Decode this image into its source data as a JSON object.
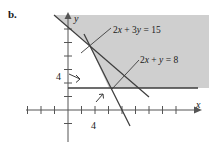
{
  "figure": {
    "part_label": "b.",
    "background_color": "#ffffff",
    "shade_color": "#cfcfcf",
    "line_color": "#3d3d3d",
    "axis_color": "#555555"
  },
  "axes": {
    "x_name": "x",
    "y_name": "y",
    "x_tick_label": "4",
    "y_tick_label": "4",
    "x_axis_y_px": 110,
    "y_axis_x_px": 68,
    "tick_spacing_px": 13.5,
    "x_ticks_left": 3,
    "x_ticks_right": 9,
    "y_ticks_up": 7,
    "y_ticks_down": 2
  },
  "labels": {
    "line1": "2x + 3y = 15",
    "line2": "2x + y = 8"
  },
  "chart_data": {
    "type": "line",
    "title": "",
    "xlabel": "x",
    "ylabel": "y",
    "grid": false,
    "legend": "none",
    "xlim": [
      -3,
      9
    ],
    "ylim": [
      -2,
      7
    ],
    "xticks": [
      -3,
      -2,
      -1,
      0,
      1,
      2,
      3,
      4,
      5,
      6,
      7,
      8,
      9
    ],
    "yticks": [
      -2,
      -1,
      0,
      1,
      2,
      3,
      4,
      5,
      6,
      7
    ],
    "xticklabels": [
      "4"
    ],
    "yticklabels": [
      "4"
    ],
    "series": [
      {
        "name": "2x + 3y = 15",
        "equation": "2x + 3y = 15",
        "slope": -0.6667,
        "intercept": 5,
        "points": [
          [
            -1.5,
            6
          ],
          [
            6,
            1
          ]
        ],
        "style": "solid"
      },
      {
        "name": "2x + y = 8",
        "equation": "2x + y = 8",
        "slope": -2,
        "intercept": 8,
        "points": [
          [
            1.2,
            5.6
          ],
          [
            4.6,
            -1.2
          ]
        ],
        "style": "solid"
      },
      {
        "name": "horizontal boundary",
        "equation": "y = 2",
        "slope": 0,
        "intercept": 2,
        "points": [
          [
            0,
            2
          ],
          [
            9,
            2
          ]
        ],
        "style": "solid"
      }
    ],
    "shaded_region": {
      "description": "feasible region above 2x + 3y = 15, right of 2x + y = 8 and above horizontal boundary",
      "fill": "#cfcfcf",
      "vertices": [
        [
          -1.0,
          7.0
        ],
        [
          9.0,
          7.0
        ],
        [
          9.0,
          2.0
        ],
        [
          3.0,
          2.0
        ],
        [
          1.55,
          4.9
        ]
      ]
    },
    "direction_arrows": [
      {
        "from": [
          0.05,
          4.35
        ],
        "to": [
          0.85,
          3.95
        ]
      },
      {
        "from": [
          2.05,
          0.55
        ],
        "to": [
          2.6,
          1.2
        ]
      }
    ]
  }
}
